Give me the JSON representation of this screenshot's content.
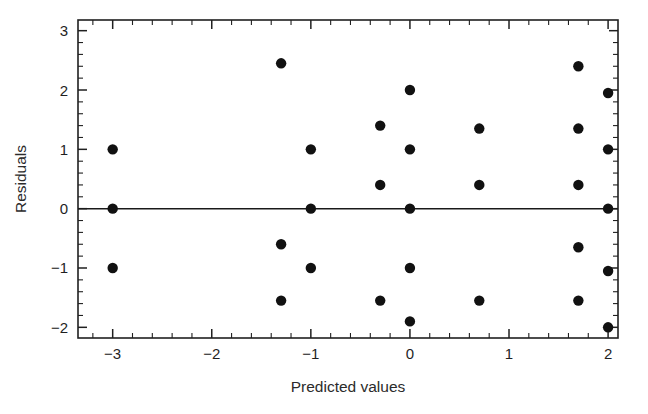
{
  "chart_data": {
    "type": "scatter",
    "title": "",
    "xlabel": "Predicted values",
    "ylabel": "Residuals",
    "xlim": [
      -3.35,
      2.1
    ],
    "ylim": [
      -2.18,
      3.18
    ],
    "xticks": [
      -3,
      -2,
      -1,
      0,
      1,
      2
    ],
    "xtick_labels": [
      "−3",
      "−2",
      "−1",
      "0",
      "1",
      "2"
    ],
    "yticks": [
      -2,
      -1,
      0,
      1,
      2,
      3
    ],
    "ytick_labels": [
      "−2",
      "−1",
      "0",
      "1",
      "2",
      "3"
    ],
    "minor_tick_step": 0.2,
    "grid": false,
    "legend": null,
    "reference_line": {
      "type": "horizontal",
      "y": 0,
      "label": "zero residual line"
    },
    "points": [
      {
        "x": -3.0,
        "y": 1.0
      },
      {
        "x": -3.0,
        "y": 0.0
      },
      {
        "x": -3.0,
        "y": -1.0
      },
      {
        "x": -1.3,
        "y": 2.45
      },
      {
        "x": -1.3,
        "y": -0.6
      },
      {
        "x": -1.3,
        "y": -1.55
      },
      {
        "x": -1.0,
        "y": 1.0
      },
      {
        "x": -1.0,
        "y": 0.0
      },
      {
        "x": -1.0,
        "y": -1.0
      },
      {
        "x": -0.3,
        "y": 1.4
      },
      {
        "x": -0.3,
        "y": 0.4
      },
      {
        "x": -0.3,
        "y": -1.55
      },
      {
        "x": 0.0,
        "y": 2.0
      },
      {
        "x": 0.0,
        "y": 1.0
      },
      {
        "x": 0.0,
        "y": 0.0
      },
      {
        "x": 0.0,
        "y": -1.0
      },
      {
        "x": 0.0,
        "y": -1.9
      },
      {
        "x": 0.7,
        "y": 1.35
      },
      {
        "x": 0.7,
        "y": 0.4
      },
      {
        "x": 0.7,
        "y": -1.55
      },
      {
        "x": 1.7,
        "y": 2.4
      },
      {
        "x": 1.7,
        "y": 1.35
      },
      {
        "x": 1.7,
        "y": 0.4
      },
      {
        "x": 1.7,
        "y": -0.65
      },
      {
        "x": 1.7,
        "y": -1.55
      },
      {
        "x": 2.0,
        "y": 1.95
      },
      {
        "x": 2.0,
        "y": 1.0
      },
      {
        "x": 2.0,
        "y": 0.0
      },
      {
        "x": 2.0,
        "y": -1.05
      },
      {
        "x": 2.0,
        "y": -2.0
      }
    ],
    "marker": {
      "shape": "circle",
      "size_px": 5.2,
      "color": "#111111"
    },
    "colors": {
      "marker": "#111111",
      "axis": "#202020",
      "text": "#1f1f1f",
      "background": "#ffffff"
    }
  },
  "plot_area": {
    "left_px": 78,
    "right_px": 618,
    "top_px": 20,
    "bottom_px": 338
  }
}
